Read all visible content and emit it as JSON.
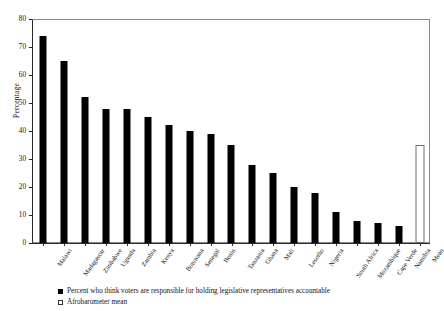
{
  "chart_data": {
    "type": "bar",
    "title": "",
    "xlabel": "",
    "ylabel": "Percentage",
    "ylim": [
      0,
      80
    ],
    "yticks": [
      0,
      10,
      20,
      30,
      40,
      50,
      60,
      70,
      80
    ],
    "grid": false,
    "legend_position": "bottom-left",
    "categories": [
      "Malawi",
      "Madagascar",
      "Zimbabwe",
      "Uganda",
      "Zambia",
      "Kenya",
      "Botswana",
      "Senegal",
      "Benin",
      "Tanzania",
      "Ghana",
      "Mali",
      "Lesotho",
      "Nigeria",
      "South Africa",
      "Mozambique",
      "Cape Verde",
      "Namibia",
      "Mean"
    ],
    "values": [
      74,
      65,
      52,
      48,
      48,
      45,
      42,
      40,
      39,
      35,
      28,
      25,
      20,
      18,
      11,
      8,
      7,
      6,
      35
    ],
    "series": [
      {
        "name": "Percent who think voters are responsible for holding legislative representatives accountable",
        "style": "filled",
        "values": [
          74,
          65,
          52,
          48,
          48,
          45,
          42,
          40,
          39,
          35,
          28,
          25,
          20,
          18,
          11,
          8,
          7,
          6,
          null
        ]
      },
      {
        "name": "Afrobarometer mean",
        "style": "hollow",
        "values": [
          null,
          null,
          null,
          null,
          null,
          null,
          null,
          null,
          null,
          null,
          null,
          null,
          null,
          null,
          null,
          null,
          null,
          null,
          35
        ]
      }
    ],
    "legend": [
      {
        "marker": "filled-square",
        "label": "Percent who think voters are responsible for holding legislative representatives accountable"
      },
      {
        "marker": "hollow-square",
        "label": "Afrobarometer mean"
      }
    ],
    "colors": {
      "bar_fill": "#000000",
      "mean_bar_fill": "#ffffff",
      "mean_bar_border": "#6e6e6e",
      "axis": "#2a2a2a",
      "frame": "#8a8a8a",
      "background": "#ffffff"
    }
  }
}
